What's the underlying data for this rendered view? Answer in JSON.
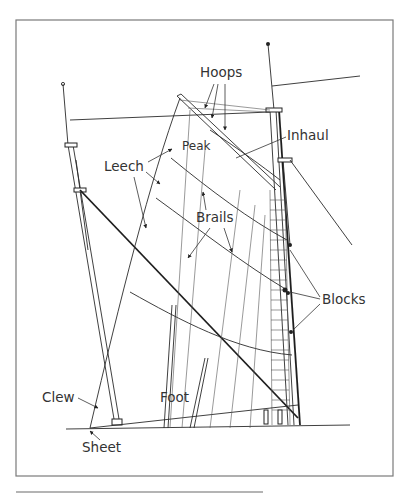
{
  "figure": {
    "labels": {
      "hoops": "Hoops",
      "inhaul": "Inhaul",
      "peak": "Peak",
      "leech": "Leech",
      "brails": "Brails",
      "blocks": "Blocks",
      "clew": "Clew",
      "foot": "Foot",
      "sheet": "Sheet"
    }
  },
  "colors": {
    "background": "#ffffff",
    "line": "#222222",
    "frame": "#7a7a7a",
    "text": "#333333"
  }
}
